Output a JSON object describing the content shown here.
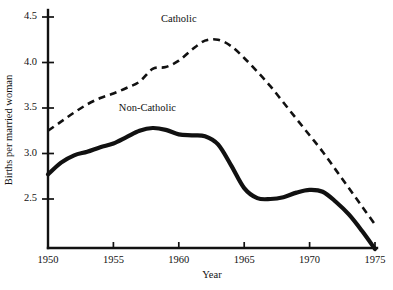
{
  "chart_data": {
    "type": "line",
    "title": "",
    "xlabel": "Year",
    "ylabel": "Births per married woman",
    "xlim": [
      1950,
      1975
    ],
    "ylim": [
      2.1,
      4.6
    ],
    "grid": false,
    "legend_position": "inline-annotation",
    "x_ticks": [
      "1950",
      "1955",
      "1960",
      "1965",
      "1970",
      "1975"
    ],
    "x_tick_values": [
      1950,
      1955,
      1960,
      1965,
      1970,
      1975
    ],
    "y_ticks": [
      "2.5",
      "3.0",
      "3.5",
      "4.0",
      "4.5"
    ],
    "y_tick_values": [
      2.5,
      3.0,
      3.5,
      4.0,
      4.5
    ],
    "series": [
      {
        "name": "Catholic",
        "style": "dashed",
        "label_text": "Catholic",
        "x": [
          1950,
          1951,
          1952,
          1953,
          1954,
          1955,
          1956,
          1957,
          1958,
          1959,
          1960,
          1961,
          1962,
          1963,
          1964,
          1965,
          1966,
          1967,
          1968,
          1969,
          1970,
          1971,
          1972,
          1973,
          1974,
          1975
        ],
        "values": [
          3.25,
          3.35,
          3.45,
          3.54,
          3.61,
          3.66,
          3.72,
          3.79,
          3.93,
          3.95,
          4.02,
          4.14,
          4.24,
          4.25,
          4.18,
          4.05,
          3.9,
          3.74,
          3.56,
          3.38,
          3.2,
          3.02,
          2.82,
          2.62,
          2.42,
          2.22
        ]
      },
      {
        "name": "Non-Catholic",
        "style": "solid",
        "label_text": "Non-Catholic",
        "x": [
          1950,
          1951,
          1952,
          1953,
          1954,
          1955,
          1956,
          1957,
          1958,
          1959,
          1960,
          1961,
          1962,
          1963,
          1964,
          1965,
          1966,
          1967,
          1968,
          1969,
          1970,
          1971,
          1972,
          1973,
          1974,
          1975
        ],
        "values": [
          2.77,
          2.9,
          2.98,
          3.02,
          3.07,
          3.11,
          3.18,
          3.25,
          3.28,
          3.26,
          3.21,
          3.2,
          3.19,
          3.1,
          2.87,
          2.62,
          2.51,
          2.5,
          2.52,
          2.57,
          2.6,
          2.58,
          2.47,
          2.33,
          2.15,
          1.95
        ]
      }
    ],
    "annotations": [
      {
        "text": "Catholic",
        "x": 1960.0,
        "y": 4.44
      },
      {
        "text": "Non-Catholic",
        "x": 1957.6,
        "y": 3.47
      }
    ]
  }
}
